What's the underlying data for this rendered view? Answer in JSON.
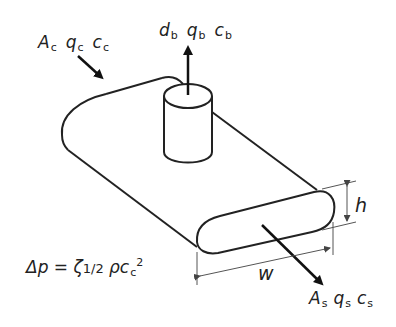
{
  "diagram": {
    "inlet_label": {
      "A": "A",
      "A_sub": "c",
      "q": "q",
      "q_sub": "c",
      "c": "c",
      "c_sub": "c"
    },
    "branch_label": {
      "d": "d",
      "d_sub": "b",
      "q": "q",
      "q_sub": "b",
      "c": "c",
      "c_sub": "b"
    },
    "outlet_label": {
      "A": "A",
      "A_sub": "s",
      "q": "q",
      "q_sub": "s",
      "c": "c",
      "c_sub": "s"
    },
    "dimension_h": "h",
    "dimension_w": "w",
    "formula": {
      "lhs": "Δp",
      "equals": "=",
      "zeta": "ζ",
      "half": "1/2",
      "rho": "ρ",
      "c": "c",
      "c_sub": "c",
      "exp": "2"
    },
    "colors": {
      "stroke": "#222222",
      "dim_line": "#555555",
      "background": "#ffffff"
    }
  }
}
